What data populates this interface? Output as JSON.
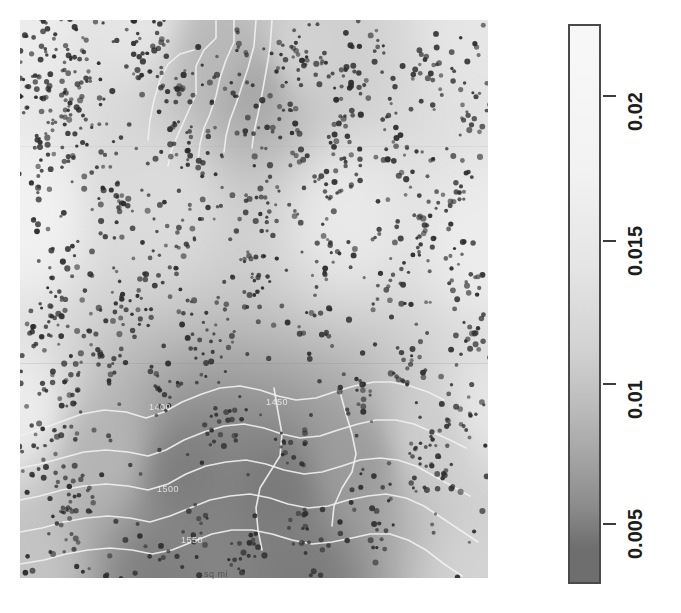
{
  "figure": {
    "type": "raster-map-with-colorbar",
    "background_color": "#ffffff",
    "width": 681,
    "height": 613
  },
  "map": {
    "name": "kriging-prediction-surface",
    "left": 20,
    "top": 20,
    "width": 468,
    "height": 558,
    "bottom_axis_note": "sq mi",
    "point_overlay_label": "sample-points",
    "point_color": "#2d2d2d",
    "contour_line_color": "#f0f0f0"
  },
  "contour_labels": [
    {
      "text": "1450",
      "x": 277,
      "y": 405
    },
    {
      "text": "1500",
      "x": 168,
      "y": 492
    },
    {
      "text": "1550",
      "x": 192,
      "y": 543
    },
    {
      "text": "1400",
      "x": 160,
      "y": 410
    }
  ],
  "colorbar": {
    "name": "value-colorbar",
    "orientation": "vertical",
    "left": 568,
    "top": 24,
    "width": 33,
    "height": 560,
    "border_color": "#4a4a4a",
    "high_color": "#f7f7f7",
    "low_color": "#6e6e6e",
    "min_value": 0.0025,
    "max_value": 0.0235,
    "ticks": [
      {
        "label": "0.02",
        "value": 0.02,
        "y": 95
      },
      {
        "label": "0.015",
        "value": 0.015,
        "y": 240
      },
      {
        "label": "0.01",
        "value": 0.01,
        "y": 383
      },
      {
        "label": "0.005",
        "value": 0.005,
        "y": 523
      }
    ]
  },
  "chart_data": {
    "type": "heatmap",
    "title": "",
    "xlabel": "sq mi",
    "ylabel": "",
    "grid": false,
    "legend_position": "right",
    "colorbar_label": "",
    "colorbar_ticks": [
      0.005,
      0.01,
      0.015,
      0.02
    ],
    "colorbar_tick_labels": [
      "0.005",
      "0.01",
      "0.015",
      "0.02"
    ],
    "value_range": [
      0.0025,
      0.0235
    ],
    "colormap": "grayscale (dark = low, light = high)",
    "overlays": [
      "scatter points",
      "contour lines"
    ],
    "contour_levels": [
      1400,
      1450,
      1500,
      1550
    ],
    "field_description": "Smooth interpolated surface: light (high ~0.022) over most of the upper-left and right areas, with two dark low-value lobes - one small lobe near the top-centre (~0.010) and one large lobe filling the bottom-left and bottom-centre (~0.004-0.007).",
    "field_nodes": [
      {
        "x": 0.0,
        "y": 0.0,
        "v": 0.0215
      },
      {
        "x": 0.25,
        "y": 0.0,
        "v": 0.0205
      },
      {
        "x": 0.42,
        "y": 0.06,
        "v": 0.013
      },
      {
        "x": 0.5,
        "y": 0.12,
        "v": 0.0105
      },
      {
        "x": 0.6,
        "y": 0.05,
        "v": 0.0175
      },
      {
        "x": 1.0,
        "y": 0.0,
        "v": 0.0205
      },
      {
        "x": 0.0,
        "y": 0.35,
        "v": 0.0225
      },
      {
        "x": 0.3,
        "y": 0.32,
        "v": 0.019
      },
      {
        "x": 0.7,
        "y": 0.35,
        "v": 0.021
      },
      {
        "x": 1.0,
        "y": 0.4,
        "v": 0.0215
      },
      {
        "x": 0.0,
        "y": 0.7,
        "v": 0.0215
      },
      {
        "x": 0.18,
        "y": 0.78,
        "v": 0.0125
      },
      {
        "x": 0.35,
        "y": 0.82,
        "v": 0.0052
      },
      {
        "x": 0.55,
        "y": 0.85,
        "v": 0.0048
      },
      {
        "x": 0.72,
        "y": 0.8,
        "v": 0.009
      },
      {
        "x": 0.88,
        "y": 0.75,
        "v": 0.0165
      },
      {
        "x": 1.0,
        "y": 0.7,
        "v": 0.0205
      },
      {
        "x": 0.0,
        "y": 1.0,
        "v": 0.015
      },
      {
        "x": 0.3,
        "y": 1.0,
        "v": 0.0055
      },
      {
        "x": 0.6,
        "y": 1.0,
        "v": 0.005
      },
      {
        "x": 1.0,
        "y": 1.0,
        "v": 0.0175
      }
    ],
    "n_points_overlaid": 1400
  }
}
